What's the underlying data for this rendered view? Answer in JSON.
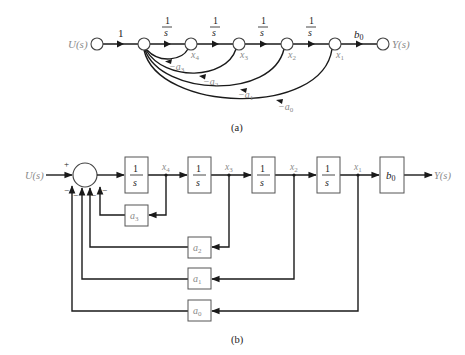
{
  "figure_a": {
    "caption": "(a)",
    "input_label": "U(s)",
    "output_label": "Y(s)",
    "forward_gains": [
      "1",
      "1",
      "1",
      "1",
      "1"
    ],
    "forward_gain_first": "1",
    "integrator_num": "1",
    "integrator_den": "s",
    "output_gain": "b",
    "output_gain_sub": "0",
    "state_labels": [
      {
        "base": "x",
        "sub": "4"
      },
      {
        "base": "x",
        "sub": "3"
      },
      {
        "base": "x",
        "sub": "2"
      },
      {
        "base": "x",
        "sub": "1"
      }
    ],
    "feedback_labels": [
      {
        "base": "−a",
        "sub": "3"
      },
      {
        "base": "−a",
        "sub": "2"
      },
      {
        "base": "−a",
        "sub": "1"
      },
      {
        "base": "−a",
        "sub": "0"
      }
    ]
  },
  "figure_b": {
    "caption": "(b)",
    "input_label": "U(s)",
    "output_label": "Y(s)",
    "sum_plus": "+",
    "sum_minus": "−",
    "integrator_num": "1",
    "integrator_den": "s",
    "output_block": {
      "base": "b",
      "sub": "0"
    },
    "state_labels": [
      {
        "base": "x",
        "sub": "4"
      },
      {
        "base": "x",
        "sub": "3"
      },
      {
        "base": "x",
        "sub": "2"
      },
      {
        "base": "x",
        "sub": "1"
      }
    ],
    "feedback_blocks": [
      {
        "base": "a",
        "sub": "3"
      },
      {
        "base": "a",
        "sub": "2"
      },
      {
        "base": "a",
        "sub": "1"
      },
      {
        "base": "a",
        "sub": "0"
      }
    ]
  },
  "colors": {
    "line": "#1a1a1a",
    "label_grey": "#8a8a8a",
    "block_border": "#555555"
  }
}
